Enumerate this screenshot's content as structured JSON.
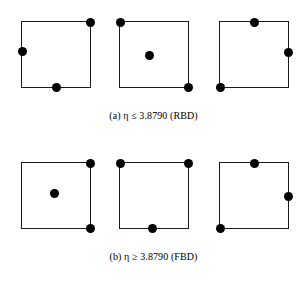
{
  "figure": {
    "panels": [
      {
        "id": "panel-a",
        "caption": "(a) η ≤ 3.8790 (RBD)",
        "caption_label": "(a)",
        "caption_symbol": "η",
        "caption_relation": "≤",
        "caption_value": "3.8790",
        "caption_method": "(RBD)",
        "squares": [
          {
            "id": "a1",
            "points": [
              {
                "name": "top-right-corner",
                "x_pct": 100,
                "y_pct": 0
              },
              {
                "name": "left-edge-point",
                "x_pct": 0,
                "y_pct": 46
              },
              {
                "name": "bottom-edge-point",
                "x_pct": 51,
                "y_pct": 100
              }
            ]
          },
          {
            "id": "a2",
            "points": [
              {
                "name": "top-left-corner",
                "x_pct": 0,
                "y_pct": 0
              },
              {
                "name": "interior-point",
                "x_pct": 43,
                "y_pct": 52
              },
              {
                "name": "bottom-right-corner",
                "x_pct": 100,
                "y_pct": 100
              }
            ]
          },
          {
            "id": "a3",
            "points": [
              {
                "name": "top-edge-point",
                "x_pct": 50,
                "y_pct": 0
              },
              {
                "name": "right-edge-point",
                "x_pct": 100,
                "y_pct": 47
              },
              {
                "name": "bottom-left-corner",
                "x_pct": 0,
                "y_pct": 100
              }
            ]
          }
        ]
      },
      {
        "id": "panel-b",
        "caption": "(b) η ≥ 3.8790 (FBD)",
        "caption_label": "(b)",
        "caption_symbol": "η",
        "caption_relation": "≥",
        "caption_value": "3.8790",
        "caption_method": "(FBD)",
        "squares": [
          {
            "id": "b1",
            "points": [
              {
                "name": "top-right-corner",
                "x_pct": 100,
                "y_pct": 0
              },
              {
                "name": "interior-point",
                "x_pct": 48,
                "y_pct": 47
              },
              {
                "name": "bottom-right-corner",
                "x_pct": 100,
                "y_pct": 100
              }
            ]
          },
          {
            "id": "b2",
            "points": [
              {
                "name": "top-left-corner",
                "x_pct": 0,
                "y_pct": 0
              },
              {
                "name": "top-right-corner",
                "x_pct": 100,
                "y_pct": 0
              },
              {
                "name": "bottom-edge-point",
                "x_pct": 48,
                "y_pct": 100
              }
            ]
          },
          {
            "id": "b3",
            "points": [
              {
                "name": "top-edge-point",
                "x_pct": 50,
                "y_pct": 0
              },
              {
                "name": "right-edge-point",
                "x_pct": 100,
                "y_pct": 52
              },
              {
                "name": "bottom-left-corner",
                "x_pct": 0,
                "y_pct": 100
              }
            ]
          }
        ]
      }
    ],
    "colors": {
      "point_fill": "#000000",
      "square_stroke": "#1a1a1a",
      "background": "#ffffff",
      "text": "#000000"
    }
  }
}
